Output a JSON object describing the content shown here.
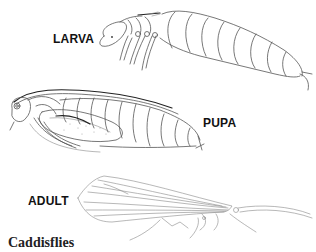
{
  "figure": {
    "caption": "Caddisflies",
    "stages": [
      {
        "id": "larva",
        "label": "LARVA"
      },
      {
        "id": "pupa",
        "label": "PUPA"
      },
      {
        "id": "adult",
        "label": "ADULT"
      }
    ]
  },
  "colors": {
    "background": "#ffffff",
    "line": "#555555",
    "text": "#111111"
  }
}
